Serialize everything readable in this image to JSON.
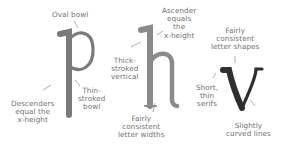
{
  "diagram": {
    "letters": [
      {
        "glyph": "p",
        "color": "#7a7a7a"
      },
      {
        "glyph": "h",
        "color": "#8a8a8a"
      },
      {
        "glyph": "v",
        "color": "#2f2f2f"
      }
    ],
    "labels": {
      "oval_bowl": "Oval bowl",
      "descenders": [
        "Descenders",
        "equal the",
        "x-height"
      ],
      "thin_bowl": [
        "Thin-",
        "stroked",
        "bowl"
      ],
      "thick_vertical": [
        "Thick-",
        "stroked",
        "vertical"
      ],
      "ascender": [
        "Ascender",
        "equals",
        "the",
        "x-height"
      ],
      "letter_widths": [
        "Fairly",
        "consistent",
        "letter widths"
      ],
      "letter_shapes": [
        "Fairly",
        "consistent",
        "letter shapes"
      ],
      "serifs": [
        "Short,",
        "thin",
        "serifs"
      ],
      "curved_lines": [
        "Slightly",
        "curved lines"
      ]
    },
    "colors": {
      "label_text": "#707070",
      "leader_line": "#9a9a9a",
      "background": "#ffffff"
    }
  }
}
